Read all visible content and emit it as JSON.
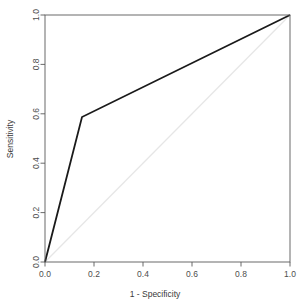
{
  "chart_data": {
    "type": "line",
    "title": "",
    "subtitle": "",
    "xlabel": "1 - Specificity",
    "ylabel": "Sensitivity",
    "xlim": [
      0.0,
      1.0
    ],
    "ylim": [
      0.0,
      1.0
    ],
    "grid": false,
    "legend": "none",
    "x_ticks": [
      0.0,
      0.2,
      0.4,
      0.6,
      0.8,
      1.0
    ],
    "y_ticks": [
      0.0,
      0.2,
      0.4,
      0.6,
      0.8,
      1.0
    ],
    "x_tick_labels": [
      "0.0",
      "0.2",
      "0.4",
      "0.6",
      "0.8",
      "1.0"
    ],
    "y_tick_labels": [
      "0.0",
      "0.2",
      "0.4",
      "0.6",
      "0.8",
      "1.0"
    ],
    "series": [
      {
        "name": "ROC curve",
        "color": "#1a1a1a",
        "width": 1.8,
        "x": [
          0.0,
          0.151,
          1.0
        ],
        "y": [
          0.0,
          0.587,
          1.0
        ]
      },
      {
        "name": "chance diagonal",
        "color": "#e6e6e6",
        "width": 1.2,
        "x": [
          0.0,
          1.0
        ],
        "y": [
          0.0,
          1.0
        ]
      }
    ]
  },
  "axes": {
    "x_title": "1 - Specificity",
    "y_title": "Sensitivity"
  },
  "colors": {
    "background": "#ffffff",
    "box": "#5a5a5a",
    "curve": "#1a1a1a",
    "diagonal": "#e6e6e6",
    "text": "#4d4d4d"
  }
}
